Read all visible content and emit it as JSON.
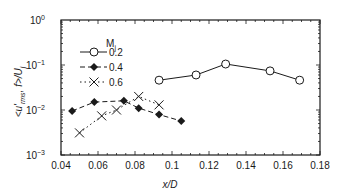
{
  "chart_data": {
    "type": "line",
    "title": "",
    "xlabel": "x/D",
    "ylabel": "<u'rms,f>/Uj",
    "xscale": "linear",
    "yscale": "log",
    "xlim": [
      0.04,
      0.18
    ],
    "ylim": [
      0.001,
      1
    ],
    "x_ticks": [
      "0.04",
      "0.06",
      "0.08",
      "0.1",
      "0.12",
      "0.14",
      "0.16",
      "0.18"
    ],
    "y_ticks": [
      "10^-3",
      "10^-2",
      "10^-1",
      "10^0"
    ],
    "grid": false,
    "legend": {
      "title": "Mj",
      "position": "upper-left"
    },
    "series": [
      {
        "name": "0.2",
        "marker": "open-circle",
        "line": "solid",
        "x": [
          0.093,
          0.113,
          0.129,
          0.153,
          0.169
        ],
        "y": [
          0.046,
          0.06,
          0.105,
          0.074,
          0.046
        ]
      },
      {
        "name": "0.4",
        "marker": "filled-diamond",
        "line": "dashed",
        "x": [
          0.046,
          0.058,
          0.074,
          0.082,
          0.093,
          0.105
        ],
        "y": [
          0.0095,
          0.015,
          0.016,
          0.011,
          0.0079,
          0.0057
        ]
      },
      {
        "name": "0.6",
        "marker": "x",
        "line": "dotted",
        "x": [
          0.05,
          0.062,
          0.07,
          0.082,
          0.093
        ],
        "y": [
          0.0031,
          0.0074,
          0.01,
          0.02,
          0.013
        ]
      }
    ]
  },
  "labels": {
    "xlabel": "x/D",
    "ylabel_main": "<u'",
    "ylabel_sub": "rms",
    "ylabel_rest": ", f>/U",
    "ylabel_tail": "j",
    "legend_title_main": "M",
    "legend_title_sub": "j"
  }
}
